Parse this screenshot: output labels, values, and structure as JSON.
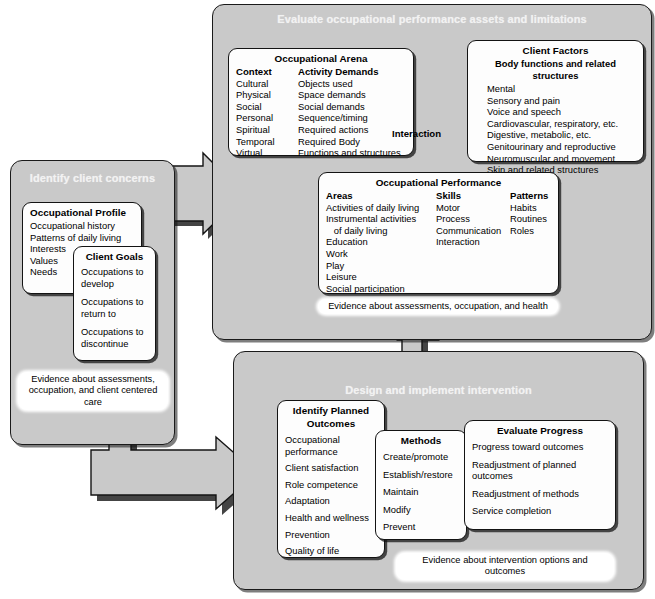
{
  "diagram": {
    "colors": {
      "panel_fill": "#c9c9c9",
      "card_fill": "#fdfdfd",
      "outline": "#141414",
      "panel_title_text": "#f2f2f2"
    }
  },
  "panels": {
    "identify": {
      "title": "Identify client concerns",
      "profile": {
        "heading": "Occupational Profile",
        "items": [
          "Occupational history",
          "Patterns of daily living",
          "Interests",
          "Values",
          "Needs"
        ]
      },
      "goals": {
        "heading": "Client Goals",
        "items": [
          "Occupations to develop",
          "Occupations to return to",
          "Occupations to discontinue"
        ]
      },
      "evidence": "Evidence about assessments, occupation, and client centered care"
    },
    "evaluate": {
      "title": "Evaluate occupational performance assets and limitations",
      "arena": {
        "heading": "Occupational Arena",
        "columns": [
          {
            "heading": "Context",
            "items": [
              "Cultural",
              "Physical",
              "Social",
              "Personal",
              "Spiritual",
              "Temporal",
              "Virtual"
            ]
          },
          {
            "heading": "Activity Demands",
            "items": [
              "Objects used",
              "Space demands",
              "Social demands",
              "Sequence/timing",
              "Required actions",
              "Required Body",
              "Functions and structures"
            ]
          }
        ]
      },
      "client_factors": {
        "heading": "Client Factors",
        "subheading": "Body functions and related structures",
        "items": [
          "Mental",
          "Sensory and pain",
          "Voice and speech",
          "Cardiovascular, respiratory, etc.",
          "Digestive, metabolic, etc.",
          "Genitourinary and reproductive",
          "Neuromuscular and movement",
          "Skin and related structures"
        ]
      },
      "interaction_label": "Interaction",
      "performance": {
        "heading": "Occupational Performance",
        "columns": [
          {
            "heading": "Areas",
            "items": [
              "Activities of daily living",
              "Instrumental activities",
              "   of daily living",
              "Education",
              "Work",
              "Play",
              "Leisure",
              "Social participation"
            ]
          },
          {
            "heading": "Skills",
            "items": [
              "Motor",
              "Process",
              "Communication",
              "Interaction"
            ]
          },
          {
            "heading": "Patterns",
            "items": [
              "Habits",
              "Routines",
              "Roles"
            ]
          }
        ]
      },
      "evidence": "Evidence about assessments, occupation, and health"
    },
    "design": {
      "title": "Design and implement intervention",
      "outcomes": {
        "heading_line1": "Identify Planned",
        "heading_line2": "Outcomes",
        "items": [
          "Occupational performance",
          "Client satisfaction",
          "Role competence",
          "Adaptation",
          "Health and wellness",
          "Prevention",
          "Quality of life"
        ]
      },
      "methods": {
        "heading": "Methods",
        "items": [
          "Create/promote",
          "Establish/restore",
          "Maintain",
          "Modify",
          "Prevent"
        ]
      },
      "progress": {
        "heading": "Evaluate Progress",
        "items": [
          "Progress toward outcomes",
          "Readjustment of planned outcomes",
          "Readjustment of methods",
          "Service completion"
        ]
      },
      "evidence": "Evidence about intervention options and outcomes"
    }
  },
  "arrows": [
    {
      "name": "identify-to-evaluate",
      "direction": "right"
    },
    {
      "name": "evaluate-to-design",
      "direction": "up-down"
    },
    {
      "name": "design-to-identify",
      "direction": "bent-left-up"
    },
    {
      "name": "interaction-three-way",
      "direction": "left-right-down"
    }
  ]
}
